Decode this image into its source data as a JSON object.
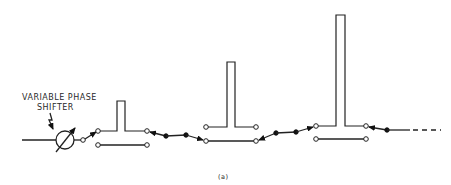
{
  "figure": {
    "label_line1": "VARIABLE PHASE",
    "label_line2": "SHIFTER",
    "caption": "(a)",
    "ink_color": "#222222",
    "background": "#ffffff"
  },
  "components": {
    "phase_shifter": {
      "name": "variable phase shifter",
      "cx": 65,
      "cy": 140,
      "r": 9
    },
    "stubs": [
      {
        "index": 1,
        "x_left": 117,
        "x_right": 125,
        "top": 101,
        "base_y": 131,
        "left_node": 98,
        "right_node": 147,
        "lower_line_y": 145
      },
      {
        "index": 2,
        "x_left": 227,
        "x_right": 235,
        "top": 62,
        "base_y": 127,
        "left_node": 206,
        "right_node": 256,
        "lower_line_y": 141
      },
      {
        "index": 3,
        "x_left": 336,
        "x_right": 345,
        "top": 15,
        "base_y": 126,
        "left_node": 316,
        "right_node": 366,
        "lower_line_y": 139
      }
    ],
    "continuation": "dashed"
  }
}
